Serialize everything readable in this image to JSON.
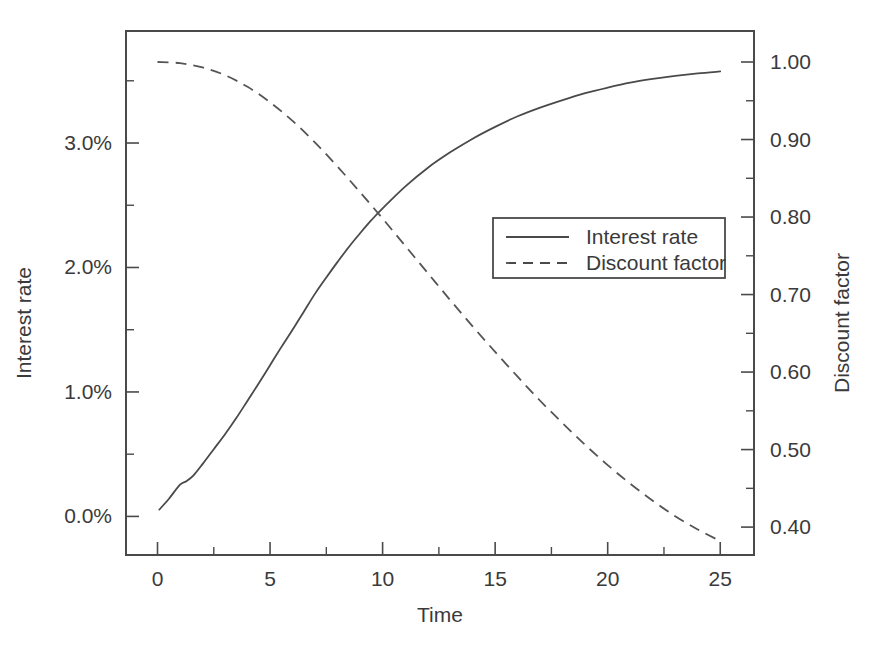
{
  "chart_data": {
    "type": "line",
    "title": "",
    "xlabel": "Time",
    "ylabel": "Interest rate",
    "y2label": "Discount factor",
    "xlim": [
      -1.4,
      26.5
    ],
    "ylim": [
      -0.0031,
      0.039
    ],
    "y2lim": [
      0.364,
      1.04
    ],
    "grid": false,
    "legend_position": "center-right",
    "xticks": [
      0,
      5,
      10,
      15,
      20,
      25
    ],
    "xticklabels": [
      "0",
      "5",
      "10",
      "15",
      "20",
      "25"
    ],
    "x_minor_ticks": [
      2.5,
      7.5,
      12.5,
      17.5,
      22.5
    ],
    "yticks": [
      0.0,
      0.01,
      0.02,
      0.03
    ],
    "yticklabels": [
      "0.0%",
      "1.0%",
      "2.0%",
      "3.0%"
    ],
    "y_minor_ticks": [
      0.005,
      0.015,
      0.025,
      0.035
    ],
    "y2ticks": [
      0.4,
      0.5,
      0.6,
      0.7,
      0.8,
      0.9,
      1.0
    ],
    "y2ticklabels": [
      "0.40",
      "0.50",
      "0.60",
      "0.70",
      "0.80",
      "0.90",
      "1.00"
    ],
    "y2_minor_ticks": [
      0.45,
      0.55,
      0.65,
      0.75,
      0.85,
      0.95
    ],
    "series": [
      {
        "name": "Interest rate",
        "style": "solid",
        "axis": "left",
        "x": [
          0.08,
          0.5,
          1.0,
          1.3,
          1.6,
          2.0,
          2.5,
          3.0,
          3.5,
          4.0,
          4.5,
          5.0,
          5.5,
          6.0,
          6.5,
          7.0,
          7.5,
          8.0,
          8.5,
          9.0,
          9.5,
          10.0,
          11.0,
          12.0,
          13.0,
          14.0,
          15.0,
          16.0,
          17.0,
          18.0,
          19.0,
          20.0,
          21.0,
          22.0,
          23.0,
          24.0,
          25.0
        ],
        "y": [
          0.00055,
          0.0014,
          0.00255,
          0.00285,
          0.0033,
          0.0042,
          0.0054,
          0.0066,
          0.0079,
          0.0093,
          0.0107,
          0.01215,
          0.0136,
          0.015,
          0.01645,
          0.0179,
          0.0192,
          0.02045,
          0.02165,
          0.02275,
          0.0238,
          0.02475,
          0.0265,
          0.028,
          0.02925,
          0.03035,
          0.0313,
          0.03215,
          0.03285,
          0.03345,
          0.034,
          0.03445,
          0.03485,
          0.03515,
          0.0354,
          0.0356,
          0.03575
        ]
      },
      {
        "name": "Discount factor",
        "style": "dashed",
        "axis": "right",
        "x": [
          0.0,
          1.0,
          2.0,
          3.0,
          4.0,
          5.0,
          6.0,
          7.0,
          8.0,
          9.0,
          10.0,
          11.0,
          12.0,
          13.0,
          14.0,
          15.0,
          16.0,
          17.0,
          18.0,
          19.0,
          20.0,
          21.0,
          22.0,
          23.0,
          24.0,
          25.0
        ],
        "y": [
          1.0,
          0.9985,
          0.993,
          0.983,
          0.968,
          0.948,
          0.924,
          0.896,
          0.865,
          0.832,
          0.798,
          0.763,
          0.728,
          0.693,
          0.659,
          0.626,
          0.594,
          0.563,
          0.534,
          0.506,
          0.48,
          0.456,
          0.434,
          0.414,
          0.397,
          0.382
        ]
      }
    ],
    "legend": [
      {
        "label": "Interest rate",
        "style": "solid"
      },
      {
        "label": "Discount factor",
        "style": "dashed"
      }
    ],
    "colors": {
      "axis": "#4a4a4a",
      "series_interest_rate": "#4a4a4a",
      "series_discount_factor": "#555555",
      "background": "#ffffff",
      "text": "#3a3a3a"
    }
  }
}
